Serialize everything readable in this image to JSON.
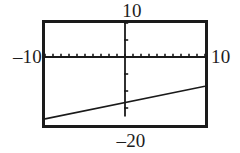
{
  "view": {
    "kind": "graphing-calculator-plot",
    "background": "#ffffff",
    "ink": "#1a1a1a"
  },
  "labels": {
    "top": "10",
    "left": "–10",
    "right": "10",
    "bottom": "–20"
  },
  "chart_data": {
    "type": "line",
    "title": "",
    "xlabel": "",
    "ylabel": "",
    "xlim": [
      -10,
      10
    ],
    "ylim": [
      -20,
      10
    ],
    "grid": false,
    "legend": null,
    "axes": {
      "x_axis_visible": true,
      "y_axis_visible": true,
      "x_tick_spacing": 1,
      "y_tick_spacing": 5,
      "x_ticks": [
        -10,
        -9,
        -8,
        -7,
        -6,
        -5,
        -4,
        -3,
        -2,
        -1,
        0,
        1,
        2,
        3,
        4,
        5,
        6,
        7,
        8,
        9,
        10
      ],
      "y_ticks": [
        -20,
        -15,
        -10,
        -5,
        0,
        5,
        10
      ]
    },
    "series": [
      {
        "name": "line",
        "x": [
          -10,
          10
        ],
        "y": [
          -18.2,
          -8.6
        ]
      }
    ]
  }
}
